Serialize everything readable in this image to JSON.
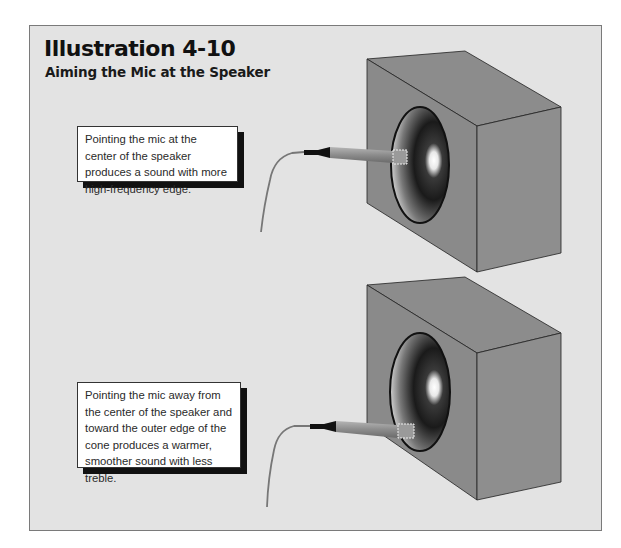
{
  "header": {
    "title": "Illustration 4-10",
    "subtitle": "Aiming the Mic at the Speaker"
  },
  "callouts": [
    {
      "text": "Pointing the mic at the center of the speaker produces a sound with more high-frequency edge."
    },
    {
      "text": "Pointing the mic away from the center of the speaker and toward the outer edge of the cone produces a warmer, smoother sound with less treble."
    }
  ],
  "figures": [
    {
      "label": "speaker-center-mic",
      "mic_position": "center of cone"
    },
    {
      "label": "speaker-edge-mic",
      "mic_position": "outer edge of cone"
    }
  ],
  "colors": {
    "panel_bg": "#e3e3e3",
    "cabinet_face": "#8a8a8a",
    "cone_dark": "#111111",
    "callout_shadow": "#111111"
  }
}
